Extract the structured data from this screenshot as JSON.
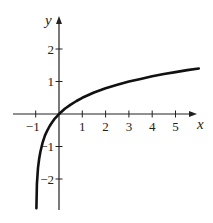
{
  "chart_data": {
    "type": "line",
    "title": "",
    "xlabel": "x",
    "ylabel": "y",
    "xlim": [
      -1.0,
      6.1
    ],
    "ylim": [
      -3.0,
      2.9
    ],
    "grid": false,
    "legend": null,
    "x_ticks": [
      -1,
      1,
      2,
      3,
      4,
      5
    ],
    "x_tick_labels": [
      "−1",
      "1",
      "2",
      "3",
      "4",
      "5"
    ],
    "y_ticks": [
      -2,
      -1,
      1,
      2
    ],
    "y_tick_labels": [
      "−2",
      "−1",
      "1",
      "2"
    ],
    "series": [
      {
        "name": "curve",
        "color": "#111111",
        "x": [
          -0.95,
          -0.9,
          -0.85,
          -0.8,
          -0.7,
          -0.6,
          -0.5,
          -0.4,
          -0.3,
          -0.2,
          -0.1,
          0,
          0.25,
          0.5,
          0.75,
          1,
          1.5,
          2,
          2.5,
          3,
          3.5,
          4,
          4.5,
          5,
          5.5,
          6
        ],
        "y": [
          -2.16,
          -1.66,
          -1.37,
          -1.16,
          -0.87,
          -0.66,
          -0.5,
          -0.37,
          -0.26,
          -0.16,
          -0.08,
          0,
          0.16,
          0.29,
          0.4,
          0.5,
          0.66,
          0.79,
          0.9,
          1.0,
          1.08,
          1.16,
          1.23,
          1.29,
          1.35,
          1.4
        ]
      }
    ]
  }
}
